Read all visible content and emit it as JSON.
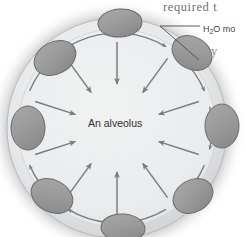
{
  "figure": {
    "name": "alveolus-surface-tension-diagram",
    "center_label": "An alveolus",
    "callout_label_prefix": "H",
    "callout_label_subscript": "2",
    "callout_label_suffix": "O mo",
    "body_text_top": "required  t",
    "body_text_fragment": "y"
  },
  "colors": {
    "interior": "#eceded",
    "rim_band": "#e2e3e4",
    "cell_fill": "#9b9b9b",
    "cell_stroke": "#6a6a6a",
    "arrow": "#7c7c7c",
    "halo_dark": "#2e2e2e",
    "page_background": "#ffffff",
    "text_serif": "#6e6e6e",
    "text_sans": "#3f3f3f"
  },
  "geometry": {
    "circle_center_x": 117,
    "circle_center_y": 128,
    "circle_radius": 110,
    "rim_arrow_radius": 95,
    "cell_count": 10,
    "radial_arrow_count": 10
  },
  "cells": [
    {
      "name": "cell-top",
      "cx": 120,
      "cy": 23,
      "rx": 22,
      "ry": 14,
      "rot": -4
    },
    {
      "name": "cell-top-right",
      "cx": 192,
      "cy": 53,
      "rx": 21,
      "ry": 16,
      "rot": 30
    },
    {
      "name": "cell-right",
      "cx": 222,
      "cy": 126,
      "rx": 17,
      "ry": 22,
      "rot": 0
    },
    {
      "name": "cell-bottom-right",
      "cx": 193,
      "cy": 196,
      "rx": 21,
      "ry": 16,
      "rot": -30
    },
    {
      "name": "cell-bottom",
      "cx": 123,
      "cy": 228,
      "rx": 22,
      "ry": 14,
      "rot": 4
    },
    {
      "name": "cell-bottom-left",
      "cx": 52,
      "cy": 196,
      "rx": 22,
      "ry": 16,
      "rot": 28
    },
    {
      "name": "cell-left",
      "cx": 28,
      "cy": 128,
      "rx": 17,
      "ry": 22,
      "rot": 0
    },
    {
      "name": "cell-top-left",
      "cx": 55,
      "cy": 58,
      "rx": 22,
      "ry": 16,
      "rot": -28
    }
  ],
  "radial_arrows": [
    {
      "name": "radial-arrow-1",
      "angle_deg": -90
    },
    {
      "name": "radial-arrow-2",
      "angle_deg": -54
    },
    {
      "name": "radial-arrow-3",
      "angle_deg": -18
    },
    {
      "name": "radial-arrow-4",
      "angle_deg": 18
    },
    {
      "name": "radial-arrow-5",
      "angle_deg": 54
    },
    {
      "name": "radial-arrow-6",
      "angle_deg": 90
    },
    {
      "name": "radial-arrow-7",
      "angle_deg": 126
    },
    {
      "name": "radial-arrow-8",
      "angle_deg": 162
    },
    {
      "name": "radial-arrow-9",
      "angle_deg": 198
    },
    {
      "name": "radial-arrow-10",
      "angle_deg": 234
    }
  ],
  "rim_arrows": [
    {
      "name": "rim-arrow-1",
      "angle_deg": -108
    },
    {
      "name": "rim-arrow-2",
      "angle_deg": -72
    },
    {
      "name": "rim-arrow-3",
      "angle_deg": -36
    },
    {
      "name": "rim-arrow-4",
      "angle_deg": 0
    },
    {
      "name": "rim-arrow-5",
      "angle_deg": 36
    },
    {
      "name": "rim-arrow-6",
      "angle_deg": 72
    },
    {
      "name": "rim-arrow-7",
      "angle_deg": 108
    },
    {
      "name": "rim-arrow-8",
      "angle_deg": 144
    },
    {
      "name": "rim-arrow-9",
      "angle_deg": 180
    },
    {
      "name": "rim-arrow-10",
      "angle_deg": 216
    }
  ],
  "leader_line": {
    "name": "h2o-leader-line",
    "points": "200,26 160,26 199,60"
  }
}
